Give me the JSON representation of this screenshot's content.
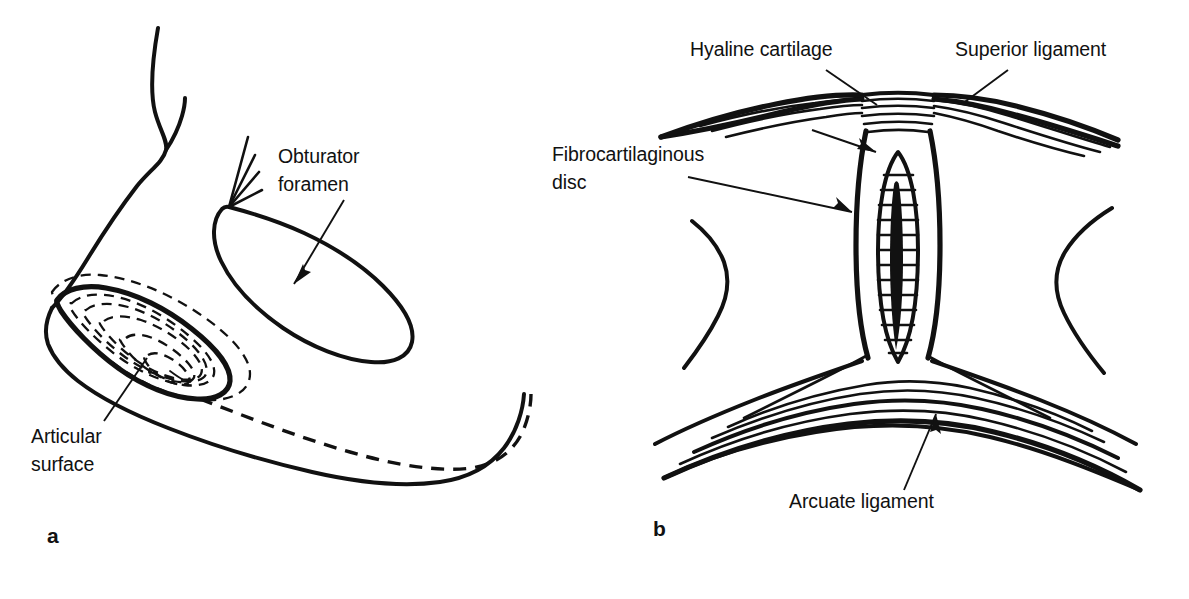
{
  "figure": {
    "background_color": "#ffffff",
    "ink_color": "#111111",
    "panels": [
      {
        "id": "a",
        "letter": "a",
        "subject": "Sacroiliac joint surface of the innominate bone, medial view",
        "annotations": [
          {
            "name": "obturator-foramen",
            "lines": [
              "Obturator",
              "foramen"
            ],
            "text": "Obturator foramen",
            "leader": "arrow",
            "text_x": 278,
            "text_y": 163
          },
          {
            "name": "articular-surface",
            "lines": [
              "Articular",
              "surface"
            ],
            "text": "Articular surface",
            "leader": "line",
            "text_x": 31,
            "text_y": 443
          }
        ]
      },
      {
        "id": "b",
        "letter": "b",
        "subject": "Coronal section through the symphysis pubis",
        "annotations": [
          {
            "name": "hyaline-cartilage",
            "lines": [
              "Hyaline cartilage"
            ],
            "text": "Hyaline cartilage",
            "leader": "line",
            "text_x": 690,
            "text_y": 56
          },
          {
            "name": "superior-ligament",
            "lines": [
              "Superior ligament"
            ],
            "text": "Superior ligament",
            "leader": "line",
            "text_x": 955,
            "text_y": 56
          },
          {
            "name": "fibrocartilaginous-disc",
            "lines": [
              "Fibrocartilaginous",
              "disc"
            ],
            "text": "Fibrocartilaginous disc",
            "leader": "arrow",
            "text_x": 552,
            "text_y": 161
          },
          {
            "name": "arcuate-ligament",
            "lines": [
              "Arcuate ligament"
            ],
            "text": "Arcuate ligament",
            "leader": "line",
            "text_x": 789,
            "text_y": 508
          }
        ]
      }
    ]
  }
}
